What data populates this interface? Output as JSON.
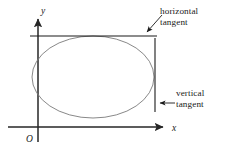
{
  "figure": {
    "type": "math-diagram",
    "background_color": "#ffffff",
    "axes": {
      "x_label": "x",
      "y_label": "y",
      "origin_label": "O",
      "axis_color": "#262626",
      "x_axis": {
        "y": 127,
        "x_start": 8,
        "x_end": 168,
        "arrow": "right"
      },
      "y_axis": {
        "x": 38,
        "y_start": 142,
        "y_end": 14,
        "arrow": "up"
      },
      "x_label_pos": {
        "x": 173,
        "y": 130
      },
      "y_label_pos": {
        "x": 42,
        "y": 13
      },
      "origin_label_pos": {
        "x": 27,
        "y": 141
      }
    },
    "curve": {
      "name": "ellipse",
      "color": "#7a7a7a",
      "stroke_width": 0.9,
      "center": {
        "x": 93,
        "y": 77
      },
      "radius_x": 61,
      "radius_y": 41
    },
    "tangents": [
      {
        "id": "horizontal-tangent",
        "label_line_1": "horizontal",
        "label_line_2": "tangent",
        "orientation": "horizontal",
        "color": "#1a1a1a",
        "line": {
          "x1": 30,
          "y1": 36,
          "x2": 157,
          "y2": 36
        },
        "arrow": {
          "x1": 161,
          "y1": 16,
          "x2": 145,
          "y2": 34
        }
      },
      {
        "id": "vertical-tangent",
        "label_line_1": "vertical",
        "label_line_2": "tangent",
        "orientation": "vertical",
        "color": "#1a1a1a",
        "line": {
          "x1": 155,
          "y1": 38,
          "x2": 155,
          "y2": 112
        },
        "arrow": {
          "x1": 174,
          "y1": 103,
          "x2": 158,
          "y2": 103
        }
      }
    ]
  }
}
